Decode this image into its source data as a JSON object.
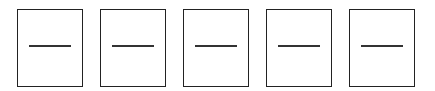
{
  "boxes": [
    {
      "symbol": "—",
      "left": 17
    },
    {
      "symbol": "—",
      "left": 100
    },
    {
      "symbol": "—",
      "left": 183
    },
    {
      "symbol": "—",
      "left": 266
    },
    {
      "symbol": "—",
      "left": 349
    }
  ],
  "colors": {
    "border": "#222222",
    "dash": "#333333",
    "background": "#ffffff"
  }
}
